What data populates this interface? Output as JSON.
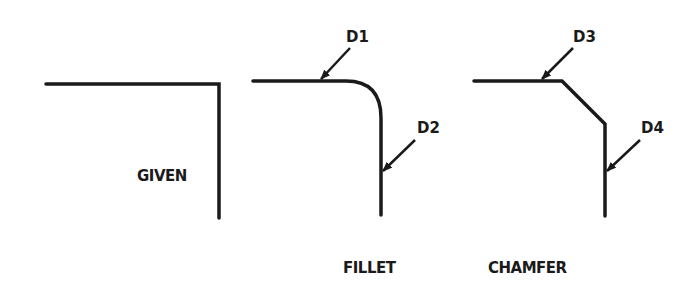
{
  "diagram": {
    "stroke_color": "#1a1a1a",
    "background": "#ffffff",
    "panels": [
      {
        "id": "given",
        "label": "GIVEN",
        "callouts": []
      },
      {
        "id": "fillet",
        "label": "FILLET",
        "callouts": [
          "D1",
          "D2"
        ]
      },
      {
        "id": "chamfer",
        "label": "CHAMFER",
        "callouts": [
          "D3",
          "D4"
        ]
      }
    ]
  },
  "labels": {
    "given": "GIVEN",
    "fillet": "FILLET",
    "chamfer": "CHAMFER",
    "d1": "D1",
    "d2": "D2",
    "d3": "D3",
    "d4": "D4"
  }
}
